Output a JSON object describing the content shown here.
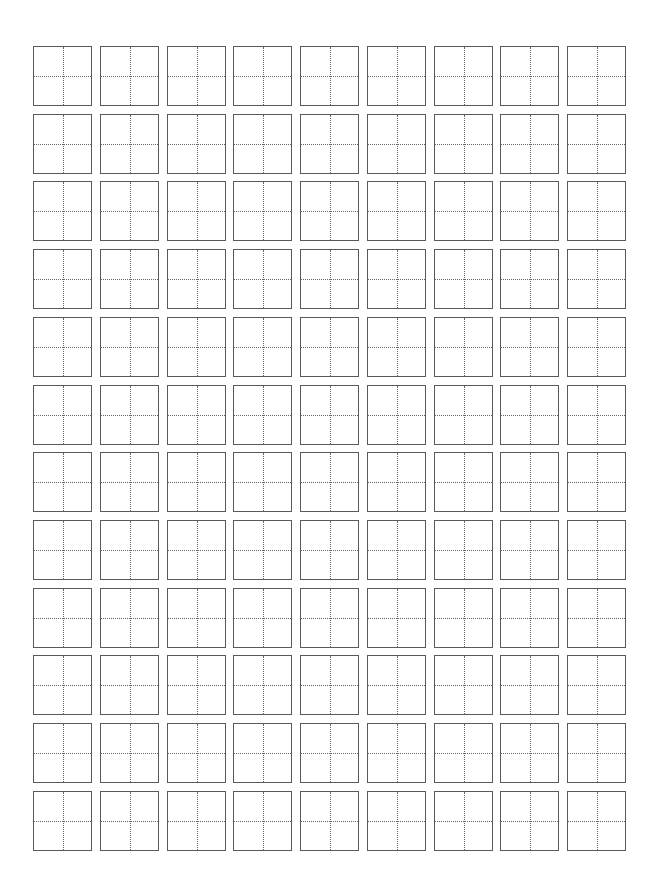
{
  "sheet": {
    "type": "tianzige-practice-grid",
    "rows": 12,
    "columns": 9,
    "cell_width": 59,
    "cell_height": 60,
    "col_pitch": 66.75,
    "row_pitch": 67.7,
    "origin_x": 33,
    "origin_y": 46,
    "border_color": "#5a5a5a",
    "guide_color": "#666666",
    "guide_style": "dotted"
  }
}
